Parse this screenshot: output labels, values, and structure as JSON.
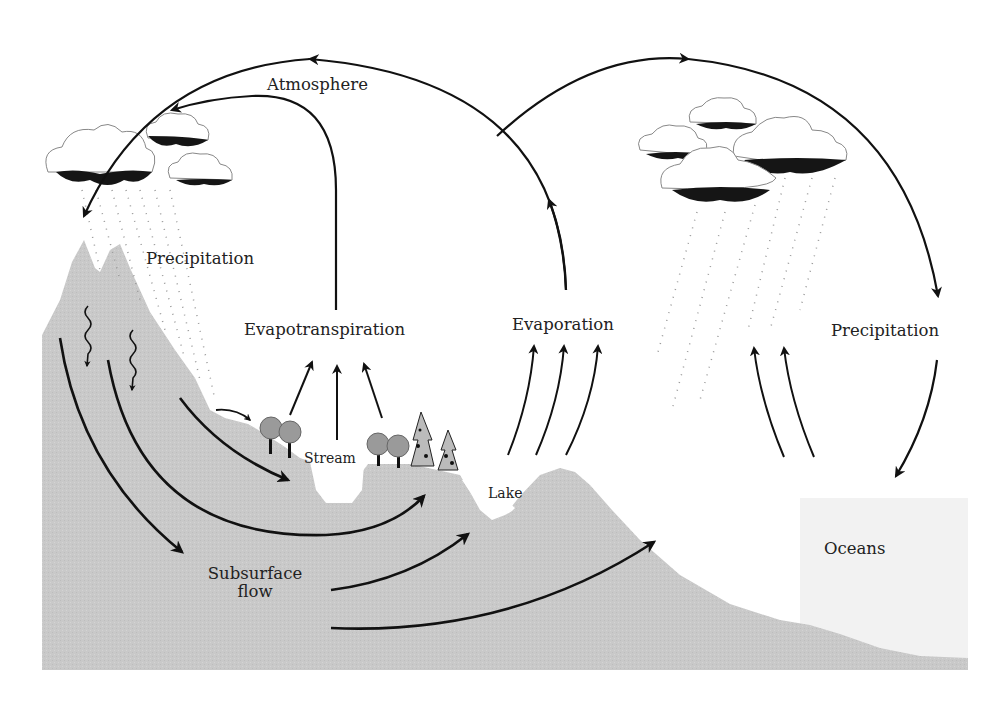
{
  "diagram": {
    "colors": {
      "land": "#c9c9c9",
      "ocean": "#f1f1f1",
      "arrow": "#111111",
      "cloud_shadow": "#151515",
      "tree": "#9a9a9a"
    },
    "labels": {
      "atmosphere": "Atmosphere",
      "precipitation_land": "Precipitation",
      "evapotranspiration": "Evapotranspiration",
      "evaporation": "Evaporation",
      "precipitation_ocean": "Precipitation",
      "stream": "Stream",
      "lake": "Lake",
      "subsurface_flow_line1": "Subsurface",
      "subsurface_flow_line2": "flow",
      "oceans": "Oceans"
    }
  }
}
